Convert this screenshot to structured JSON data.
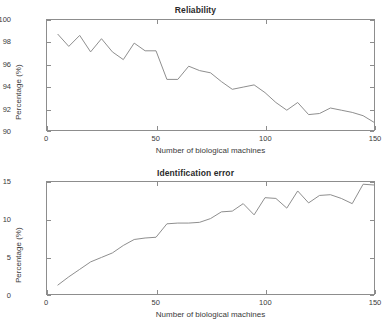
{
  "figure": {
    "width": 391,
    "height": 326,
    "background": "#ffffff",
    "line_color": "#8c8c8c",
    "axis_color": "#8d8d8d",
    "text_color": "#3a3a3a"
  },
  "chart_data": [
    {
      "type": "line",
      "title": "Reliability",
      "xlabel": "Number of biological machines",
      "ylabel": "Percentage (%)",
      "xlim": [
        0,
        150
      ],
      "ylim": [
        90,
        100
      ],
      "xticks": [
        0,
        50,
        100,
        150
      ],
      "yticks": [
        90,
        92,
        94,
        96,
        98,
        100
      ],
      "grid": false,
      "legend": null,
      "series": [
        {
          "name": "Reliability",
          "x": [
            5,
            10,
            15,
            20,
            25,
            30,
            35,
            40,
            45,
            50,
            55,
            60,
            65,
            70,
            75,
            80,
            85,
            90,
            95,
            100,
            105,
            110,
            115,
            120,
            125,
            130,
            135,
            140,
            145,
            150
          ],
          "values": [
            98.7,
            97.6,
            98.6,
            97.1,
            98.3,
            97.1,
            96.4,
            97.9,
            97.2,
            97.2,
            94.6,
            94.6,
            95.8,
            95.4,
            95.2,
            94.4,
            93.7,
            93.9,
            94.1,
            93.4,
            92.5,
            91.8,
            92.5,
            91.4,
            91.5,
            92.0,
            91.8,
            91.6,
            91.3,
            90.7
          ]
        }
      ]
    },
    {
      "type": "line",
      "title": "Identification error",
      "xlabel": "Number of biological machines",
      "ylabel": "Percentage (%)",
      "xlim": [
        0,
        150
      ],
      "ylim": [
        0,
        15
      ],
      "xticks": [
        0,
        50,
        100,
        150
      ],
      "yticks": [
        0,
        5,
        10,
        15
      ],
      "grid": false,
      "legend": null,
      "series": [
        {
          "name": "Identification error",
          "x": [
            5,
            10,
            15,
            20,
            25,
            30,
            35,
            40,
            45,
            50,
            55,
            60,
            65,
            70,
            75,
            80,
            85,
            90,
            95,
            100,
            105,
            110,
            115,
            120,
            125,
            130,
            135,
            140,
            145,
            150
          ],
          "values": [
            1.2,
            2.3,
            3.3,
            4.3,
            4.9,
            5.5,
            6.5,
            7.3,
            7.5,
            7.6,
            9.4,
            9.5,
            9.5,
            9.6,
            10.1,
            11.0,
            11.1,
            12.1,
            10.6,
            12.9,
            12.8,
            11.5,
            13.8,
            12.2,
            13.2,
            13.3,
            12.8,
            12.1,
            14.7,
            14.6
          ]
        }
      ]
    }
  ],
  "panels": [
    {
      "title": "Reliability",
      "ylabel": "Percentage (%)",
      "xlabel": "Number of biological machines",
      "ytick_labels": [
        "100",
        "98",
        "96",
        "94",
        "92",
        "90"
      ],
      "xtick_labels": [
        "0",
        "50",
        "100",
        "150"
      ]
    },
    {
      "title": "Identification error",
      "ylabel": "Percentage (%)",
      "xlabel": "Number of biological machines",
      "ytick_labels": [
        "15",
        "10",
        "5",
        "0"
      ],
      "xtick_labels": [
        "0",
        "50",
        "100",
        "150"
      ]
    }
  ]
}
